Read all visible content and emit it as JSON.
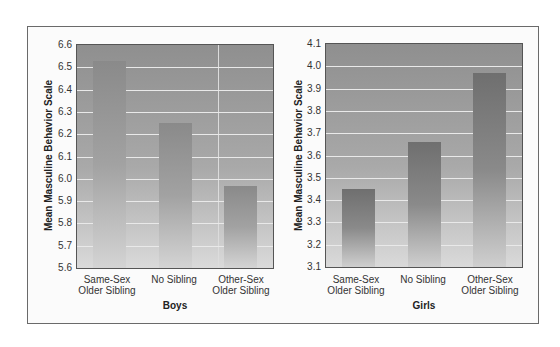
{
  "chart_data": [
    {
      "type": "bar",
      "title": "",
      "xlabel": "Boys",
      "ylabel": "Mean Masculine Behavior Scale",
      "categories": [
        "Same-Sex Older Sibling",
        "No Sibling",
        "Other-Sex Older Sibling"
      ],
      "values": [
        6.53,
        6.25,
        5.97
      ],
      "ylim": [
        5.6,
        6.6
      ],
      "yticks": [
        "6.6",
        "6.5",
        "6.4",
        "6.3",
        "6.2",
        "6.1",
        "6.0",
        "5.9",
        "5.8",
        "5.7",
        "5.6"
      ],
      "grid": true,
      "legend": null
    },
    {
      "type": "bar",
      "title": "",
      "xlabel": "Girls",
      "ylabel": "Mean Masculine Behavior Scale",
      "categories": [
        "Same-Sex Older Sibling",
        "No Sibling",
        "Other-Sex Older Sibling"
      ],
      "values": [
        3.45,
        3.66,
        3.97
      ],
      "ylim": [
        3.1,
        4.1
      ],
      "yticks": [
        "4.1",
        "4.0",
        "3.9",
        "3.8",
        "3.7",
        "3.6",
        "3.5",
        "3.4",
        "3.3",
        "3.2",
        "3.1"
      ],
      "grid": true,
      "legend": null
    }
  ],
  "boys": {
    "xlabel": "Boys",
    "ylabel": "Mean Masculine Behavior Scale",
    "cat_line1": [
      "Same-Sex",
      "No Sibling",
      "Other-Sex"
    ],
    "cat_line2": [
      "Older Sibling",
      "",
      "Older Sibling"
    ],
    "yticks": [
      "6.6",
      "6.5",
      "6.4",
      "6.3",
      "6.2",
      "6.1",
      "6.0",
      "5.9",
      "5.8",
      "5.7",
      "5.6"
    ]
  },
  "girls": {
    "xlabel": "Girls",
    "ylabel": "Mean Masculine Behavior Scale",
    "cat_line1": [
      "Same-Sex",
      "No Sibling",
      "Other-Sex"
    ],
    "cat_line2": [
      "Older Sibling",
      "",
      "Older Sibling"
    ],
    "yticks": [
      "4.1",
      "4.0",
      "3.9",
      "3.8",
      "3.7",
      "3.6",
      "3.5",
      "3.4",
      "3.3",
      "3.2",
      "3.1"
    ]
  }
}
